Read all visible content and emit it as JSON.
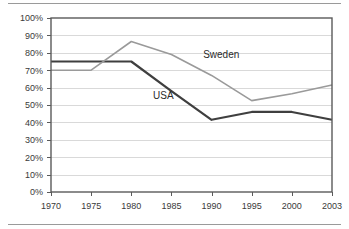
{
  "figure": {
    "has_top_rule": true,
    "has_bottom_rule": true
  },
  "chart_data": {
    "type": "line",
    "title": "",
    "subtitle": "",
    "xlabel": "",
    "ylabel": "",
    "categories": [
      "1970",
      "1975",
      "1980",
      "1985",
      "1990",
      "1995",
      "2000",
      "2003"
    ],
    "x": [
      1970,
      1975,
      1980,
      1985,
      1990,
      1995,
      2000,
      2003
    ],
    "series": [
      {
        "name": "USA",
        "color": "#3f3f3f",
        "line_width": 2.2,
        "values": [
          75,
          75,
          75,
          58,
          41.5,
          46,
          46,
          41.5
        ],
        "label_text": "USA",
        "label_x": 1984.0,
        "label_y": 53.5
      },
      {
        "name": "Sweden",
        "color": "#9a9a9a",
        "line_width": 1.6,
        "values": [
          70,
          70,
          86.5,
          79,
          67,
          52.5,
          56.5,
          61.5
        ],
        "label_text": "Sweden",
        "label_x": 1991.2,
        "label_y": 77.0
      }
    ],
    "ylim": [
      0,
      100
    ],
    "ytick_values": [
      0,
      10,
      20,
      30,
      40,
      50,
      60,
      70,
      80,
      90,
      100
    ],
    "ytick_labels": [
      "0%",
      "10%",
      "20%",
      "30%",
      "40%",
      "50%",
      "60%",
      "70%",
      "80%",
      "90%",
      "100%"
    ],
    "xtick_labels": [
      "1970",
      "1975",
      "1980",
      "1985",
      "1990",
      "1995",
      "2000",
      "2003"
    ],
    "grid": {
      "horizontal": true,
      "vertical": false,
      "color": "#d9d9d9"
    },
    "legend": {
      "position": "inline-annotations",
      "entries": [
        "USA",
        "Sweden"
      ]
    },
    "axis_color": "#5a5a5a",
    "plot_background": "#ffffff",
    "frame": true
  }
}
